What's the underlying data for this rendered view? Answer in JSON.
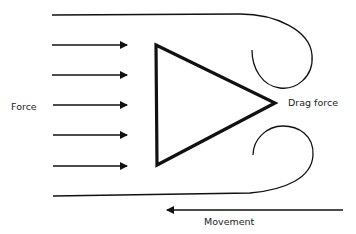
{
  "diagram": {
    "labels": {
      "force": "Force",
      "drag_force": "Drag force",
      "movement": "Movement"
    },
    "force_arrows": [
      {
        "y": 45
      },
      {
        "y": 75
      },
      {
        "y": 105
      },
      {
        "y": 135
      },
      {
        "y": 166
      }
    ],
    "colors": {
      "stroke": "#111111",
      "background": "#ffffff"
    }
  }
}
